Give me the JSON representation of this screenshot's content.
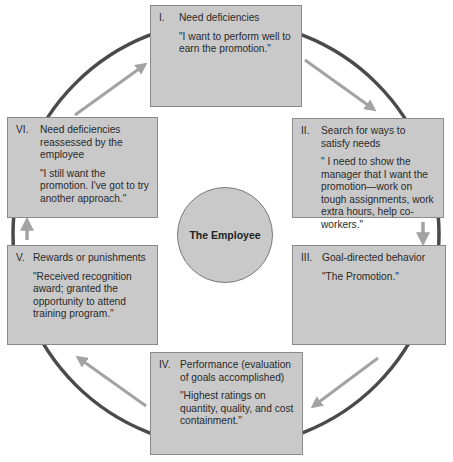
{
  "diagram": {
    "center": {
      "label": "The Employee"
    },
    "stages": [
      {
        "numeral": "I.",
        "title": "Need deficiencies",
        "quote": "\"I want to perform well to earn the promotion.\""
      },
      {
        "numeral": "II.",
        "title": "Search for ways to satisfy needs",
        "quote": "\" I need to show the manager that I want the promotion—work on tough assignments, work extra hours, help co-workers.\""
      },
      {
        "numeral": "III.",
        "title": "Goal-directed behavior",
        "quote": "\"The Promotion.\""
      },
      {
        "numeral": "IV.",
        "title": "Performance (evaluation of goals accomplished)",
        "quote": "\"Highest ratings on quantity, quality, and cost containment.\""
      },
      {
        "numeral": "V.",
        "title": "Rewards or punishments",
        "quote": "\"Received recognition award; granted the opportunity to attend training program.\""
      },
      {
        "numeral": "VI.",
        "title": "Need deficiencies reassessed by the employee",
        "quote": "\"I still want the promotion. I've got to try another approach.\""
      }
    ],
    "flow": [
      "I",
      "II",
      "III",
      "IV",
      "V",
      "VI",
      "I"
    ],
    "colors": {
      "box_fill": "#c9c9c9",
      "box_border": "#8a8a8a",
      "ring": "#4a4a4a",
      "arrow": "#a3a3a3"
    }
  }
}
